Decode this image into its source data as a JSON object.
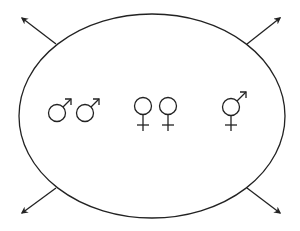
{
  "diagram": {
    "stroke_color": "#222222",
    "background": "#ffffff",
    "ellipse": {
      "cx": 152,
      "cy": 116,
      "rx": 133,
      "ry": 102
    },
    "groups": [
      {
        "name": "male-pair",
        "symbols": [
          "♂",
          "♂"
        ]
      },
      {
        "name": "female-pair",
        "symbols": [
          "♀",
          "♀"
        ]
      },
      {
        "name": "male-female",
        "symbols": [
          "⚥"
        ]
      }
    ],
    "arrows": [
      {
        "name": "arrow-top-left"
      },
      {
        "name": "arrow-top-right"
      },
      {
        "name": "arrow-bottom-left"
      },
      {
        "name": "arrow-bottom-right"
      }
    ]
  }
}
